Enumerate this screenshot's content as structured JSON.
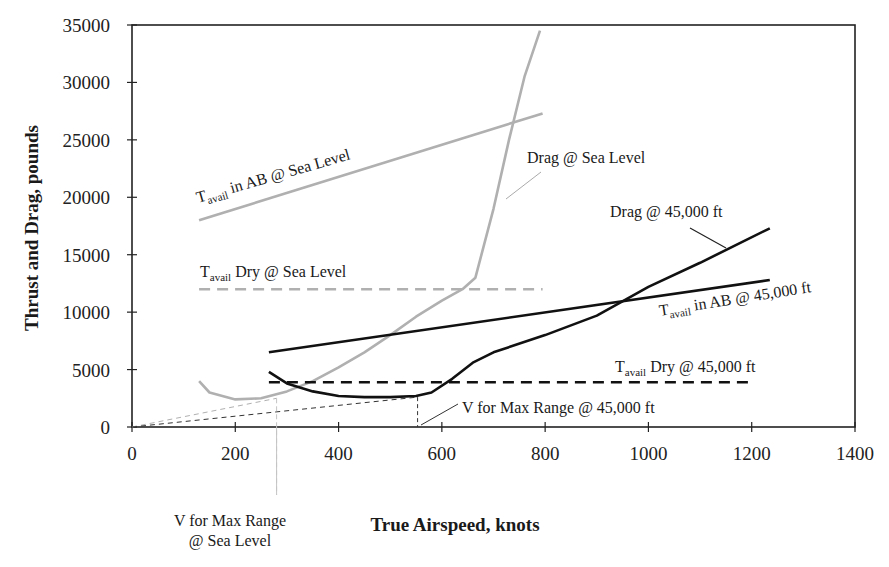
{
  "chart_data": {
    "type": "line",
    "title": "",
    "xlabel": "True Airspeed, knots",
    "ylabel": "Thrust and Drag, pounds",
    "xlim": [
      0,
      1400
    ],
    "ylim": [
      0,
      35000
    ],
    "xticks": [
      0,
      200,
      400,
      600,
      800,
      1000,
      1200,
      1400
    ],
    "yticks": [
      0,
      5000,
      10000,
      15000,
      20000,
      25000,
      30000,
      35000
    ],
    "grid": false,
    "legend": "none (curves labeled inline)",
    "series": [
      {
        "name": "Tavail in AB @ Sea Level",
        "color": "#b0b0b0",
        "style": "solid",
        "x": [
          130,
          795
        ],
        "y": [
          18000,
          27300
        ]
      },
      {
        "name": "Tavail Dry @ Sea Level",
        "color": "#b0b0b0",
        "style": "dashed",
        "x": [
          130,
          795
        ],
        "y": [
          12000,
          12000
        ]
      },
      {
        "name": "Drag @ Sea Level",
        "color": "#b0b0b0",
        "style": "solid",
        "x": [
          130,
          150,
          200,
          250,
          300,
          350,
          400,
          450,
          500,
          550,
          600,
          640,
          665,
          700,
          730,
          760,
          790
        ],
        "y": [
          4000,
          3000,
          2400,
          2500,
          3100,
          4000,
          5200,
          6500,
          8000,
          9600,
          11000,
          12000,
          13000,
          19000,
          25000,
          30500,
          34500
        ]
      },
      {
        "name": "Tavail in AB @ 45,000 ft",
        "color": "#111111",
        "style": "solid",
        "x": [
          265,
          1235
        ],
        "y": [
          6500,
          12800
        ]
      },
      {
        "name": "Tavail Dry @ 45,000 ft",
        "color": "#111111",
        "style": "dashed",
        "x": [
          265,
          1200
        ],
        "y": [
          3900,
          3900
        ]
      },
      {
        "name": "Drag @ 45,000 ft",
        "color": "#111111",
        "style": "solid",
        "x": [
          265,
          300,
          350,
          400,
          450,
          500,
          550,
          580,
          620,
          660,
          700,
          800,
          900,
          960,
          1000,
          1100,
          1235
        ],
        "y": [
          4800,
          3800,
          3100,
          2700,
          2600,
          2600,
          2700,
          3000,
          4200,
          5600,
          6500,
          8000,
          9700,
          11200,
          12200,
          14300,
          17300
        ]
      },
      {
        "name": "Tangent line (Sea Level)",
        "color": "#b0b0b0",
        "style": "dotted",
        "x": [
          0,
          280
        ],
        "y": [
          0,
          2500
        ]
      },
      {
        "name": "Tangent line (45,000 ft)",
        "color": "#333333",
        "style": "dashed",
        "x": [
          0,
          553
        ],
        "y": [
          0,
          2600
        ]
      }
    ],
    "annotations": [
      {
        "text": "Tavail in AB @ Sea Level",
        "subscript": "avail"
      },
      {
        "text": "Tavail Dry @ Sea Level",
        "subscript": "avail"
      },
      {
        "text": "Drag @ Sea Level"
      },
      {
        "text": "Drag @ 45,000 ft"
      },
      {
        "text": "Tavail in AB @ 45,000 ft",
        "subscript": "avail"
      },
      {
        "text": "Tavail Dry @ 45,000 ft",
        "subscript": "avail"
      },
      {
        "text": "V for Max Range @ 45,000 ft",
        "x": 553
      },
      {
        "text": "V for Max Range @ Sea Level",
        "x": 280
      }
    ]
  },
  "labels": {
    "y_axis_title": "Thrust and Drag, pounds",
    "x_axis_title": "True Airspeed, knots",
    "ab_sl": {
      "t": "T",
      "sub": "avail",
      "rest": " in AB @ Sea Level"
    },
    "dry_sl": {
      "t": "T",
      "sub": "avail",
      "rest": " Dry @ Sea Level"
    },
    "drag_sl": "Drag @ Sea Level",
    "drag_45": "Drag @ 45,000 ft",
    "ab_45": {
      "t": "T",
      "sub": "avail",
      "rest": " in AB @ 45,000 ft"
    },
    "dry_45": {
      "t": "T",
      "sub": "avail",
      "rest": " Dry @ 45,000 ft"
    },
    "vmr_45": "V for Max Range @ 45,000 ft",
    "vmr_sl_line1": "V for Max Range",
    "vmr_sl_line2": "@ Sea Level"
  }
}
